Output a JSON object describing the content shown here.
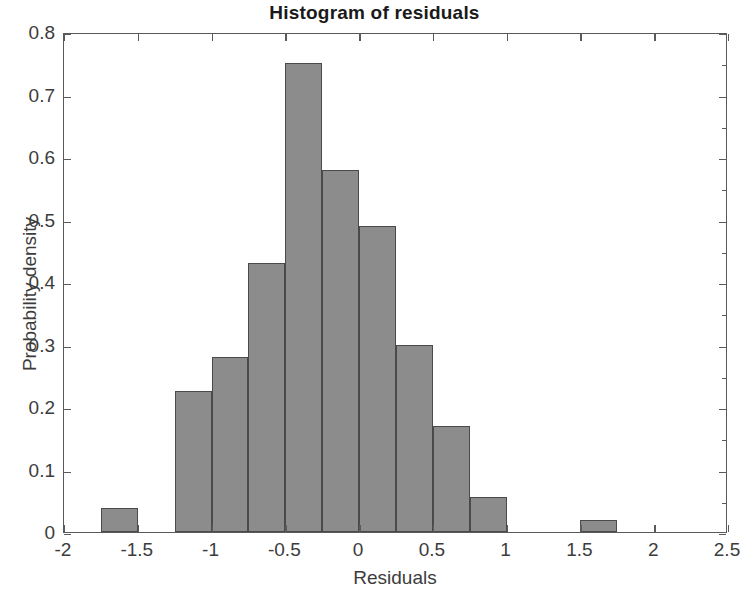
{
  "chart_data": {
    "type": "bar",
    "title": "Histogram of residuals",
    "xlabel": "Residuals",
    "ylabel": "Probability density",
    "xlim": [
      -2,
      2.5
    ],
    "ylim": [
      0,
      0.8
    ],
    "grid": false,
    "legend": null,
    "bin_width": 0.25,
    "xticks": [
      -2,
      -1.5,
      -1,
      -0.5,
      0,
      0.5,
      1,
      1.5,
      2,
      2.5
    ],
    "xtick_labels": [
      "-2",
      "-1.5",
      "-1",
      "-0.5",
      "0",
      "0.5",
      "1",
      "1.5",
      "2",
      "2.5"
    ],
    "yticks": [
      0,
      0.1,
      0.2,
      0.3,
      0.4,
      0.5,
      0.6,
      0.7,
      0.8
    ],
    "ytick_labels": [
      "0",
      "0.1",
      "0.2",
      "0.3",
      "0.4",
      "0.5",
      "0.6",
      "0.7",
      "0.8"
    ],
    "bars": [
      {
        "bin_start": -1.75,
        "bin_end": -1.5,
        "value": 0.039
      },
      {
        "bin_start": -1.25,
        "bin_end": -1.0,
        "value": 0.225
      },
      {
        "bin_start": -1.0,
        "bin_end": -0.75,
        "value": 0.28
      },
      {
        "bin_start": -0.75,
        "bin_end": -0.5,
        "value": 0.43
      },
      {
        "bin_start": -0.5,
        "bin_end": -0.25,
        "value": 0.75
      },
      {
        "bin_start": -0.25,
        "bin_end": 0.0,
        "value": 0.58
      },
      {
        "bin_start": 0.0,
        "bin_end": 0.25,
        "value": 0.49
      },
      {
        "bin_start": 0.25,
        "bin_end": 0.5,
        "value": 0.3
      },
      {
        "bin_start": 0.5,
        "bin_end": 0.75,
        "value": 0.17
      },
      {
        "bin_start": 0.75,
        "bin_end": 1.0,
        "value": 0.056
      },
      {
        "bin_start": 1.5,
        "bin_end": 1.75,
        "value": 0.02
      }
    ],
    "bar_fill_color": "#8c8c8c",
    "bar_edge_color": "#4a4a4a",
    "axis_color": "#5a5a5a"
  }
}
